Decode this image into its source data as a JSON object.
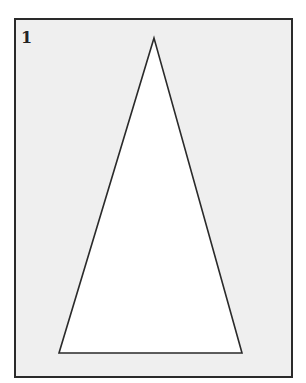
{
  "figure": {
    "number_label": "1",
    "shape": "isosceles-triangle",
    "colors": {
      "frame": "#2a2a2a",
      "background": "#efefef",
      "triangle_fill": "#ffffff",
      "triangle_stroke": "#2a2a2a"
    }
  }
}
